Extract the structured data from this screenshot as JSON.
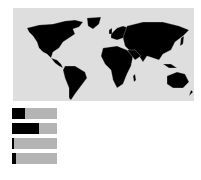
{
  "chart_data": {
    "type": "bar",
    "orientation": "horizontal",
    "title": "",
    "xlabel": "",
    "ylabel": "",
    "categories": [
      "1",
      "2",
      "3",
      "4"
    ],
    "values": [
      29,
      60,
      5,
      9
    ],
    "xlim": [
      0,
      100
    ],
    "grid": false,
    "legend": null,
    "colors": {
      "fill": "#000000",
      "track": "#b4b4b4",
      "map_land": "#000000",
      "map_ocean": "#dedede"
    }
  },
  "map": {
    "type": "world-choropleth",
    "land_color": "#000000",
    "ocean_color": "#dedede"
  }
}
